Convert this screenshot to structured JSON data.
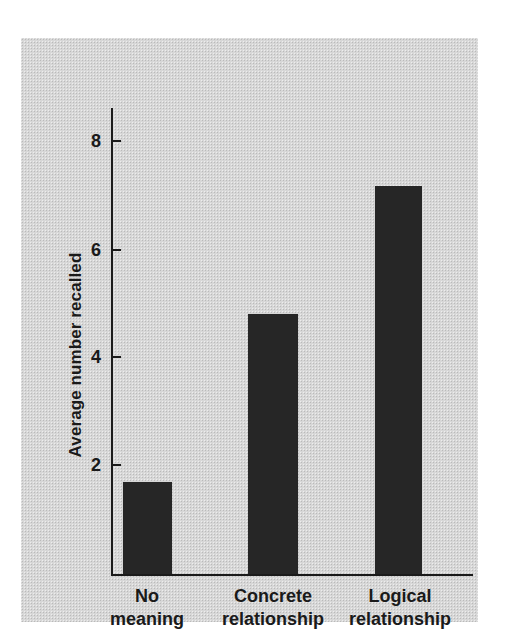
{
  "chart_data": {
    "type": "bar",
    "title": "",
    "xlabel": "",
    "ylabel": "Average number recalled",
    "categories": [
      "No meaning",
      "Concrete relationship",
      "Logical relationship"
    ],
    "category_lines": [
      [
        "No",
        "meaning"
      ],
      [
        "Concrete",
        "relationship"
      ],
      [
        "Logical",
        "relationship"
      ]
    ],
    "values": [
      1.7,
      4.8,
      7.15
    ],
    "ylim": [
      0,
      8.6
    ],
    "yticks": [
      2,
      4,
      6,
      8
    ],
    "ytick_labels": [
      "2",
      "4",
      "6",
      "8"
    ],
    "grid": false,
    "legend": false
  },
  "style": {
    "panel_background": "#d7d7d7",
    "bar_color": "#262626",
    "axis_color": "#1a1a1a",
    "text_color": "#1a1a1a",
    "page_background": "#ffffff"
  }
}
